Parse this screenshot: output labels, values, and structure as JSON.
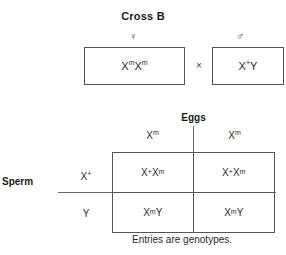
{
  "title": "Cross B",
  "parents": {
    "female": {
      "symbol": "♀",
      "symbol_name": "female-symbol",
      "genotype_base": "X",
      "genotype_display": "XmXm",
      "alleles": [
        {
          "gene": "X",
          "sup": "m"
        },
        {
          "gene": "X",
          "sup": "m"
        }
      ]
    },
    "male": {
      "symbol": "♂",
      "symbol_name": "male-symbol",
      "genotype_display": "X+Y",
      "alleles": [
        {
          "gene": "X",
          "sup": "+"
        },
        {
          "gene": "Y",
          "sup": ""
        }
      ]
    },
    "operator": "×"
  },
  "axes": {
    "columns_label": "Eggs",
    "rows_label": "Sperm"
  },
  "punnett": {
    "column_headers": [
      {
        "gene": "X",
        "sup": "m"
      },
      {
        "gene": "X",
        "sup": "m"
      }
    ],
    "row_headers": [
      {
        "gene": "X",
        "sup": "+"
      },
      {
        "gene": "Y",
        "sup": ""
      }
    ],
    "cells": [
      [
        {
          "parts": [
            {
              "gene": "X",
              "sup": "+"
            },
            {
              "gene": "X",
              "sup": "m"
            }
          ],
          "text": "X+Xm"
        },
        {
          "parts": [
            {
              "gene": "X",
              "sup": "+"
            },
            {
              "gene": "X",
              "sup": "m"
            }
          ],
          "text": "X+Xm"
        }
      ],
      [
        {
          "parts": [
            {
              "gene": "X",
              "sup": "m"
            },
            {
              "gene": "Y",
              "sup": ""
            }
          ],
          "text": "XmY"
        },
        {
          "parts": [
            {
              "gene": "X",
              "sup": "m"
            },
            {
              "gene": "Y",
              "sup": ""
            }
          ],
          "text": "XmY"
        }
      ]
    ]
  },
  "caption": "Entries are genotypes.",
  "colors": {
    "background": "#ffffff",
    "text": "#1a1a1a",
    "border": "#555555",
    "rule": "#6b6b6b"
  }
}
